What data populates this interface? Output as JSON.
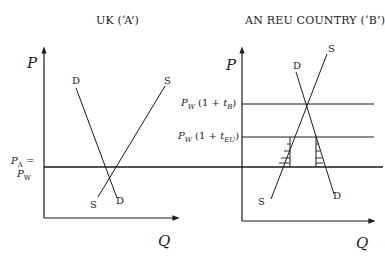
{
  "left_panel": {
    "title": "UK (‘A’)",
    "y_axis_label": "P",
    "x_axis_label": "Q",
    "demand_label_top": "D",
    "demand_label_bottom": "D",
    "supply_label_top": "S",
    "supply_label_bottom": "S",
    "price_line_label_1": "P",
    "price_line_label_1_sub": "A",
    "price_line_label_1_suffix": " =",
    "price_line_label_2": "P",
    "price_line_label_2_sub": "W"
  },
  "right_panel": {
    "title": "AN REU COUNTRY (‘B’)",
    "y_axis_label": "P",
    "x_axis_label": "Q",
    "demand_label_top": "D",
    "demand_label_bottom": "D",
    "supply_label_top": "S",
    "supply_label_bottom": "S",
    "tariff_b_label": {
      "p": "P",
      "sub": "W",
      "rest": " (1 + ",
      "t": "t",
      "tsub": "B",
      "close": ")"
    },
    "tariff_eu_label": {
      "p": "P",
      "sub": "W",
      "rest": " (1 + ",
      "t": "t",
      "tsub": "EU",
      "close": ")"
    }
  },
  "colors": {
    "line": "#1a1a1a",
    "background": "#ffffff"
  }
}
